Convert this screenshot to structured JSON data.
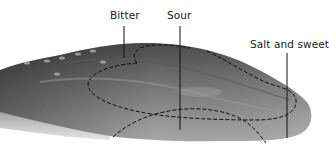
{
  "figure": {
    "labels": [
      {
        "id": "bitter",
        "text": "Bitter"
      },
      {
        "id": "sour",
        "text": "Sour"
      },
      {
        "id": "salt_sweet",
        "text": "Salt and sweet"
      }
    ],
    "colors": {
      "background": "#ffffff",
      "tongue_dark": "#3f3f3f",
      "tongue_mid": "#7a7a7a",
      "tongue_light": "#b8b8b8",
      "lines": "#111111"
    }
  }
}
